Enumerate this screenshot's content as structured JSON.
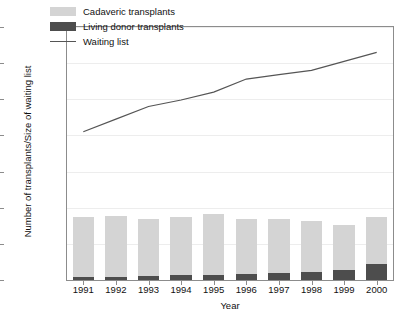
{
  "chart_data": {
    "type": "bar",
    "title": "",
    "xlabel": "Year",
    "ylabel": "Number of transplants/Size of waiting list",
    "categories": [
      "1991",
      "1992",
      "1993",
      "1994",
      "1995",
      "1996",
      "1997",
      "1998",
      "1999",
      "2000"
    ],
    "ylim": [
      0,
      7000
    ],
    "yticks": [
      0,
      1000,
      2000,
      3000,
      4000,
      5000,
      6000,
      7000
    ],
    "ytick_labels": [
      "0",
      "1000",
      "2000",
      "3000",
      "4000",
      "5000",
      "6000",
      "7000"
    ],
    "grid": true,
    "legend_position": "top-left inside",
    "stacked": true,
    "series": [
      {
        "name": "Cadaveric transplants",
        "type": "bar",
        "color": "#d4d4d4",
        "values": [
          1660,
          1665,
          1560,
          1620,
          1700,
          1520,
          1510,
          1390,
          1250,
          1300
        ]
      },
      {
        "name": "Living donor transplants",
        "type": "bar",
        "color": "#4d4d4d",
        "values": [
          90,
          95,
          120,
          130,
          140,
          170,
          190,
          230,
          280,
          440
        ]
      },
      {
        "name": "Waiting list",
        "type": "line",
        "color": "#555555",
        "values": [
          4100,
          4450,
          4800,
          4980,
          5200,
          5560,
          5680,
          5800,
          6050,
          6300
        ]
      }
    ],
    "totals": [
      1750,
      1760,
      1680,
      1750,
      1840,
      1690,
      1700,
      1620,
      1530,
      1740
    ]
  },
  "legend": {
    "items": [
      {
        "label": "Cadaveric transplants",
        "marker": "swatch-light"
      },
      {
        "label": "Living donor transplants",
        "marker": "swatch-dark"
      },
      {
        "label": "Waiting list",
        "marker": "line"
      }
    ]
  },
  "axes": {
    "y_title": "Number of transplants/Size of waiting list",
    "x_title": "Year"
  }
}
